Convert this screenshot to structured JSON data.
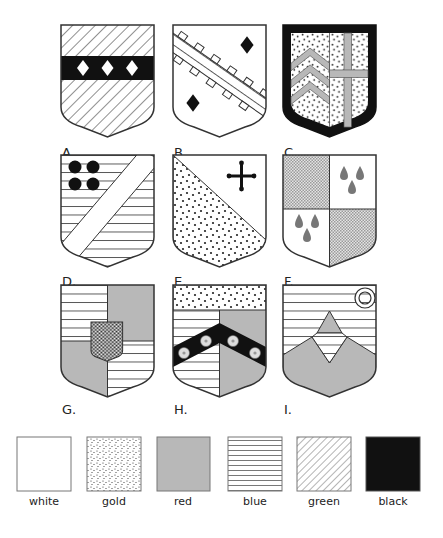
{
  "shields": [
    {
      "id": "A",
      "label": "A."
    },
    {
      "id": "B",
      "label": "B."
    },
    {
      "id": "C",
      "label": "C."
    },
    {
      "id": "D",
      "label": "D."
    },
    {
      "id": "E",
      "label": "E."
    },
    {
      "id": "F",
      "label": "F."
    },
    {
      "id": "G",
      "label": "G."
    },
    {
      "id": "H",
      "label": "H."
    },
    {
      "id": "I",
      "label": "I."
    }
  ],
  "legend": [
    {
      "tincture": "white",
      "label": "white"
    },
    {
      "tincture": "gold",
      "label": "gold"
    },
    {
      "tincture": "red",
      "label": "red"
    },
    {
      "tincture": "blue",
      "label": "blue"
    },
    {
      "tincture": "green",
      "label": "green"
    },
    {
      "tincture": "black",
      "label": "black"
    }
  ],
  "colors": {
    "outline": "#333333",
    "red_fill": "#b8b8b8",
    "black_fill": "#111111",
    "white_fill": "#ffffff"
  }
}
